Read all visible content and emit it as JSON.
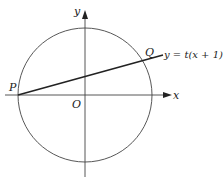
{
  "diagram": {
    "axes": {
      "x_label": "x",
      "y_label": "y",
      "origin_label": "O"
    },
    "circle": {
      "center": [
        85,
        95
      ],
      "radius": 67
    },
    "points": {
      "P": "P",
      "Q": "Q"
    },
    "line": {
      "equation_label": "y = t(x + 1)"
    },
    "colors": {
      "stroke": "#333333",
      "background": "#ffffff"
    }
  }
}
